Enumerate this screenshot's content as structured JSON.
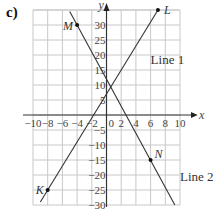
{
  "panel_label": "c)",
  "chart_data": {
    "type": "line",
    "title": "",
    "xlabel": "x",
    "ylabel": "y",
    "xlim": [
      -10,
      10
    ],
    "ylim": [
      -30,
      35
    ],
    "grid": true,
    "x_ticks": [
      -10,
      -8,
      -6,
      -4,
      -2,
      0,
      2,
      4,
      6,
      8,
      10
    ],
    "y_ticks": [
      -30,
      -25,
      -20,
      -15,
      -10,
      -5,
      5,
      10,
      15,
      20,
      25,
      30
    ],
    "series": [
      {
        "name": "Line 1",
        "equation": "y = 4x + 7",
        "x": [
          -9,
          7
        ],
        "y": [
          -29,
          35
        ]
      },
      {
        "name": "Line 2",
        "equation": "y = -4.5x + 12",
        "x": [
          -5,
          9.3
        ],
        "y": [
          34.5,
          -30
        ]
      }
    ],
    "points": [
      {
        "label": "K",
        "x": -8,
        "y": -25,
        "series": "Line 1"
      },
      {
        "label": "L",
        "x": 7,
        "y": 35,
        "series": "Line 1"
      },
      {
        "label": "M",
        "x": -4,
        "y": 30,
        "series": "Line 2"
      },
      {
        "label": "N",
        "x": 6,
        "y": -15,
        "series": "Line 2"
      }
    ],
    "annotations": [
      {
        "text": "Line 1",
        "x": 6,
        "y": 17
      },
      {
        "text": "Line 2",
        "x": 10,
        "y": -22
      }
    ]
  }
}
